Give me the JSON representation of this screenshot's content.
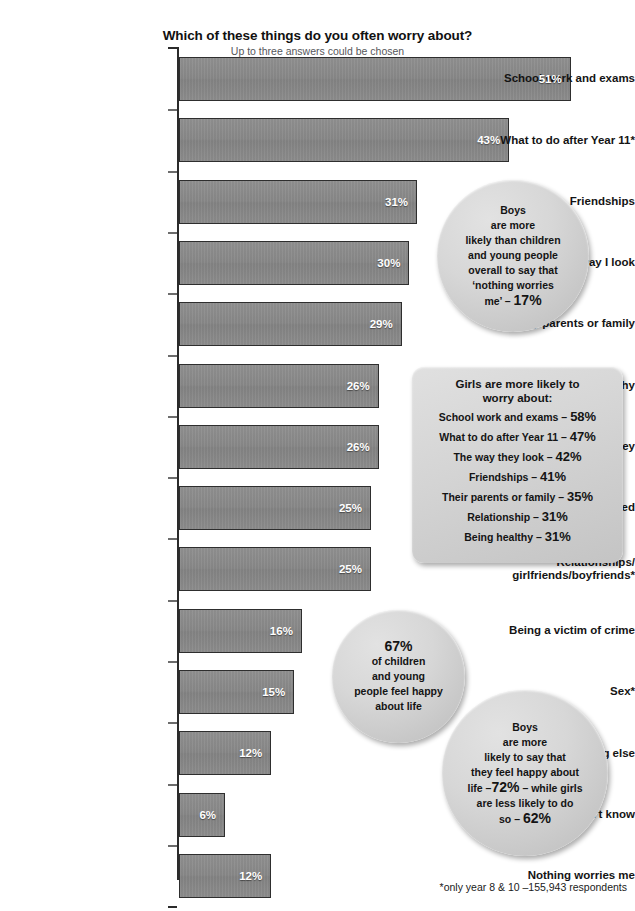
{
  "chart_data": {
    "type": "bar",
    "orientation": "horizontal",
    "title": "Which of these things do you often worry about?",
    "subtitle": "Up to three answers could be chosen",
    "xlabel": "",
    "ylabel": "",
    "xlim": [
      0,
      55
    ],
    "grid": false,
    "legend": "none",
    "value_suffix": "%",
    "categories": [
      "School work and exams",
      "What to do after Year 11*",
      "Friendships",
      "The way I look",
      "My parents or family",
      "Being healthy",
      "Money",
      "Being bullied",
      "Relationships/\ngirlfriends/boyfriends*",
      "Being a victim of crime",
      "Sex*",
      "Something else",
      "Don't know",
      "Nothing worries me"
    ],
    "values": [
      51,
      43,
      31,
      30,
      29,
      26,
      26,
      25,
      25,
      16,
      15,
      12,
      6,
      12
    ],
    "labels": [
      "51%",
      "43%",
      "31%",
      "30%",
      "29%",
      "26%",
      "26%",
      "25%",
      "25%",
      "16%",
      "15%",
      "12%",
      "6%",
      "12%"
    ],
    "bar_color": "#8a8a8a",
    "bar_border_color": "#2e2e2e",
    "value_label_color": "#ffffff"
  },
  "annotations": {
    "bubble_boys_nothing": {
      "lines": [
        "Boys",
        "are more",
        "likely than children",
        "and young people",
        "overall to say that",
        "‘nothing worries"
      ],
      "last_line_prefix": "me’ – ",
      "last_line_value": "17%"
    },
    "panel_girls": {
      "heading_line1": "Girls are more likely to",
      "heading_line2": "worry about:",
      "items": [
        {
          "label": "School work and exams – ",
          "value": "58%"
        },
        {
          "label": "What to do after Year 11 – ",
          "value": "47%"
        },
        {
          "label": "The way they look – ",
          "value": "42%"
        },
        {
          "label": "Friendships – ",
          "value": "41%"
        },
        {
          "label": "Their parents or family – ",
          "value": "35%"
        },
        {
          "label": "Relationship – ",
          "value": "31%"
        },
        {
          "label": "Being healthy – ",
          "value": "31%"
        }
      ]
    },
    "bubble_happy": {
      "value": "67%",
      "lines": [
        "of children",
        "and young",
        "people feel happy",
        "about life"
      ]
    },
    "bubble_boys_happy": {
      "lines": [
        "Boys",
        "are more",
        "likely to say that",
        "they feel happy about"
      ],
      "line_life_prefix": "life –",
      "line_life_value": "72%",
      "line_life_suffix": " – while girls",
      "line_less": "are less likely to do",
      "line_so_prefix": "so – ",
      "line_so_value": "62%"
    }
  },
  "footnote": "*only year 8 & 10 –155,943 respondents"
}
